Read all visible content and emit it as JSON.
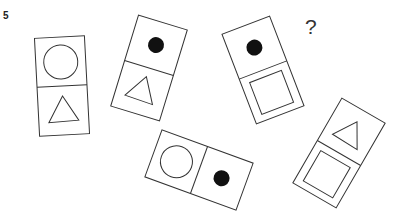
{
  "question": {
    "number": "5",
    "unknown_marker": "?"
  },
  "colors": {
    "stroke": "#333333",
    "fill_dot": "#111111",
    "background": "#ffffff"
  },
  "dominoes": [
    {
      "id": 1,
      "cx": 62,
      "cy": 86,
      "w": 50,
      "h": 98,
      "rotate": -3,
      "top": "circle",
      "bottom": "triangle"
    },
    {
      "id": 2,
      "cx": 149,
      "cy": 68,
      "w": 51,
      "h": 95,
      "rotate": 17,
      "top": "dot",
      "bottom": "triangle"
    },
    {
      "id": 3,
      "cx": 263,
      "cy": 70,
      "w": 51,
      "h": 96,
      "rotate": -21,
      "top": "dot",
      "bottom": "square"
    },
    {
      "id": 4,
      "cx": 199,
      "cy": 170,
      "w": 50,
      "h": 97,
      "rotate": -70,
      "top": "circle",
      "bottom": "dot"
    },
    {
      "id": 5,
      "cx": 339,
      "cy": 153,
      "w": 50,
      "h": 98,
      "rotate": 30,
      "top": "triangle",
      "bottom": "square"
    }
  ]
}
